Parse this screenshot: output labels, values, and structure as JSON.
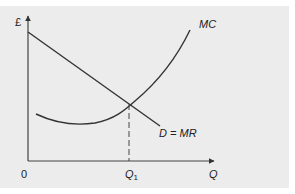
{
  "diagram": {
    "type": "economics-cost-revenue",
    "y_axis_label": "£",
    "x_axis_label": "Q",
    "origin_label": "0",
    "q1_label_main": "Q",
    "q1_label_sub": "1",
    "mc_label": "MC",
    "demand_label": "D = MR",
    "colors": {
      "background": "#ececec",
      "line": "#333333"
    }
  }
}
